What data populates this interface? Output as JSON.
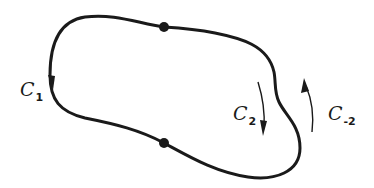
{
  "diagram": {
    "type": "closed-contour",
    "stroke_color": "#1a1a1a",
    "labels": {
      "c1": {
        "base": "C",
        "sub": "1"
      },
      "c2": {
        "base": "C",
        "sub": "2"
      },
      "cm2": {
        "base": "C",
        "sub": "-2"
      }
    },
    "nodes": [
      {
        "name": "top-point",
        "x": 164,
        "y": 27
      },
      {
        "name": "bottom-point",
        "x": 164,
        "y": 143
      }
    ],
    "arrows": [
      {
        "name": "c1-direction",
        "direction": "down"
      },
      {
        "name": "c2-direction",
        "direction": "down"
      },
      {
        "name": "c-minus-2-direction",
        "direction": "up"
      }
    ]
  }
}
